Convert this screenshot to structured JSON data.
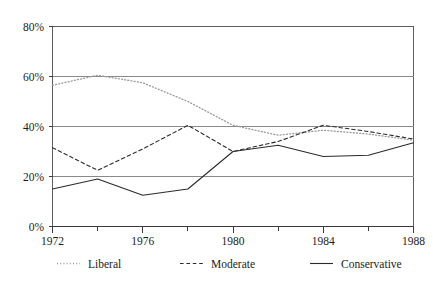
{
  "chart_data": {
    "type": "line",
    "title": "",
    "subtitle": "",
    "xlabel": "",
    "ylabel": "",
    "xlim": [
      1972,
      1988
    ],
    "ylim": [
      0,
      80
    ],
    "grid": true,
    "gridlines_y": [
      20,
      40,
      60,
      80
    ],
    "legend_position": "bottom",
    "x": [
      1972,
      1974,
      1976,
      1978,
      1980,
      1982,
      1984,
      1986,
      1988
    ],
    "xtick_labels": [
      "1972",
      "1976",
      "1980",
      "1984",
      "1988"
    ],
    "xtick_values": [
      1972,
      1976,
      1980,
      1984,
      1988
    ],
    "ytick_labels": [
      "0%",
      "20%",
      "40%",
      "60%",
      "80%"
    ],
    "ytick_values": [
      0,
      20,
      40,
      60,
      80
    ],
    "series": [
      {
        "name": "Liberal",
        "style": "dotted",
        "color": "#9a9a9a",
        "values": [
          56.5,
          60.5,
          57.5,
          50.0,
          40.5,
          36.5,
          38.5,
          37.0,
          34.5
        ]
      },
      {
        "name": "Moderate",
        "style": "dashed",
        "color": "#2b2b2b",
        "values": [
          31.5,
          22.5,
          31.0,
          40.5,
          30.0,
          34.0,
          40.5,
          38.0,
          35.0
        ]
      },
      {
        "name": "Conservative",
        "style": "solid",
        "color": "#2b2b2b",
        "values": [
          15.0,
          19.0,
          12.5,
          15.0,
          30.0,
          32.5,
          28.0,
          28.5,
          33.5
        ]
      }
    ]
  },
  "legend": {
    "items": [
      {
        "label": "Liberal",
        "swatch": "dotted-line-swatch"
      },
      {
        "label": "Moderate",
        "swatch": "dashed-line-swatch"
      },
      {
        "label": "Conservative",
        "swatch": "solid-line-swatch"
      }
    ]
  }
}
